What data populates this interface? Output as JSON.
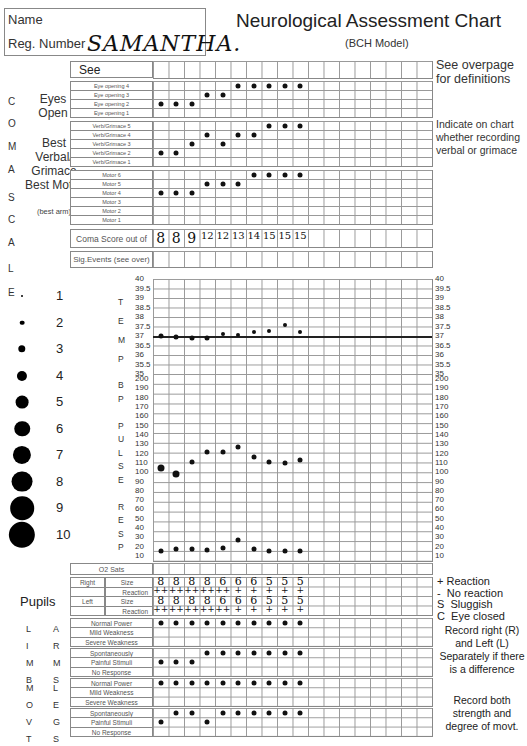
{
  "header": {
    "name_label": "Name",
    "reg_label": "Reg. Number",
    "patient_name": "SAMANTHA.",
    "title": "Neurological Assessment Chart",
    "subtitle": "(BCH Model)"
  },
  "notes": {
    "definitions": "See overpage for definitions",
    "verbal": "Indicate on chart whether recording verbal or grimace",
    "pupil_key": [
      "+ Reaction",
      "-  No reaction",
      "S  Sluggish",
      "C  Eye closed"
    ],
    "limbs": "Record right (R) and Left (L) Separately if there is a difference",
    "movement": "Record both strength and degree of movt."
  },
  "coma": {
    "side_letters": [
      "C",
      "O",
      "M",
      "A",
      "S",
      "C",
      "A",
      "L",
      "E"
    ],
    "see_overpage": "See overpage",
    "eyes": {
      "label": "Eyes Open",
      "rows": [
        "Eye opening 4",
        "Eye opening 3",
        "Eye opening 2",
        "Eye opening 1"
      ]
    },
    "verbal": {
      "label": "Best Verbal/ Grimace",
      "rows": [
        "Verb/Grimace 5",
        "Verb/Grimace 4",
        "Verb/Grimace 3",
        "Verb/Grimace 2",
        "Verb/Grimace 1"
      ]
    },
    "motor": {
      "label": "Best Motor",
      "sublabel": "(best arm)",
      "rows": [
        "Motor 6",
        "Motor 5",
        "Motor 4",
        "Motor 3",
        "Motor 2",
        "Motor 1"
      ]
    },
    "score_label": "Coma Score out of 15",
    "scores": [
      "8",
      "8",
      "9",
      "12",
      "12",
      "13",
      "14",
      "15",
      "15",
      "15"
    ],
    "sig_events_label": "Sig.Events (see over)"
  },
  "observations": {
    "eye_values": [
      2,
      2,
      2,
      3,
      3,
      4,
      4,
      4,
      4,
      4
    ],
    "verbal_values": [
      2,
      2,
      3,
      4,
      3,
      4,
      4,
      5,
      5,
      5
    ],
    "motor_values": [
      4,
      4,
      4,
      5,
      5,
      5,
      6,
      6,
      6,
      6
    ]
  },
  "pupil_legend": {
    "sizes": [
      "1",
      "2",
      "3",
      "4",
      "5",
      "6",
      "7",
      "8",
      "9",
      "10"
    ]
  },
  "vitals": {
    "temp_letters": [
      "T",
      "E",
      "M",
      "P"
    ],
    "temp_ticks": [
      "40",
      "39.5",
      "39",
      "38.5",
      "38",
      "37.5",
      "37",
      "36.5",
      "36",
      "35.5",
      "35"
    ],
    "bp_letters": [
      "B",
      "P",
      "",
      "P",
      "U",
      "L",
      "S",
      "E",
      "",
      "R",
      "E",
      "S",
      "P"
    ],
    "bp_ticks": [
      "200",
      "190",
      "180",
      "170",
      "160",
      "150",
      "140",
      "130",
      "120",
      "110",
      "100",
      "90",
      "80",
      "70",
      "60",
      "50",
      "40",
      "30",
      "20",
      "10"
    ],
    "o2_label": "O2 Sats"
  },
  "chart_data": {
    "type": "line",
    "title": "Neurological Assessment Chart",
    "x": [
      1,
      2,
      3,
      4,
      5,
      6,
      7,
      8,
      9,
      10
    ],
    "series": [
      {
        "name": "Temp (°C)",
        "values": [
          37.0,
          36.95,
          36.9,
          36.9,
          37.1,
          37.05,
          37.2,
          37.25,
          37.6,
          37.2
        ],
        "ylim": [
          35,
          40
        ]
      },
      {
        "name": "Pulse",
        "values": [
          105,
          98,
          111,
          121,
          121,
          126,
          116,
          111,
          110,
          113
        ],
        "ylim": [
          10,
          200
        ]
      },
      {
        "name": "Resp",
        "values": [
          20,
          22,
          22,
          21,
          23,
          31,
          22,
          20,
          20,
          20
        ],
        "ylim": [
          10,
          200
        ]
      },
      {
        "name": "Coma Score",
        "values": [
          8,
          8,
          9,
          12,
          12,
          13,
          14,
          15,
          15,
          15
        ]
      }
    ]
  },
  "pupils": {
    "label": "Pupils",
    "right_label": "Right",
    "left_label": "Left",
    "size_label": "Size",
    "reaction_label": "Reaction",
    "right_sizes": [
      "8",
      "8",
      "8",
      "8",
      "6",
      "6",
      "6",
      "5",
      "5",
      "5"
    ],
    "right_reactions": [
      "++",
      "++",
      "++",
      "++",
      "++",
      "+",
      "+",
      "+",
      "+",
      "+"
    ],
    "left_sizes": [
      "8",
      "8",
      "8",
      "8",
      "6",
      "6",
      "6",
      "5",
      "5",
      "5"
    ],
    "left_reactions": [
      "++",
      "++",
      "++",
      "++",
      "++",
      "+",
      "+",
      "+",
      "+",
      "+"
    ]
  },
  "limbs": {
    "side_limb": [
      "L",
      "I",
      "M",
      "B",
      "",
      "M",
      "O",
      "V",
      "T"
    ],
    "side_arms": [
      "A",
      "R",
      "M",
      "S"
    ],
    "side_legs": [
      "L",
      "E",
      "G",
      "S"
    ],
    "arms_power": [
      "Normal Power",
      "Mild Weakness",
      "Severe Weakness"
    ],
    "arms_move": [
      "Spontaneously",
      "Painful Stimuli",
      "No Response"
    ],
    "legs_power": [
      "Normal Power",
      "Mild Weakness",
      "Severe Weakness"
    ],
    "legs_move": [
      "Spontaneously",
      "Painful Stimuli",
      "No Response"
    ]
  }
}
